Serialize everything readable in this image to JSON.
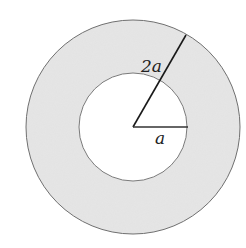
{
  "diagram": {
    "title": "",
    "colors": {
      "background": "#ffffff",
      "ring_fill": "#e6e6e6",
      "outline": "#6e6e6e",
      "radius_line": "#1a1a1a",
      "label": "#222222"
    },
    "center": {
      "x": 133,
      "y": 127
    },
    "outer_circle": {
      "radius": 107
    },
    "inner_circle": {
      "radius": 54
    },
    "labels": {
      "outer_radius": "2a",
      "inner_radius": "a"
    }
  }
}
